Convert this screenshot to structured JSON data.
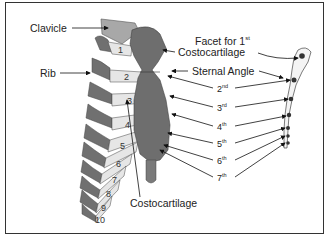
{
  "figure": {
    "type": "anatomical illustration",
    "labels": {
      "clavicle": "Clavicle",
      "rib": "Rib",
      "facet_line1": "Facet for 1",
      "facet_sup": "st",
      "facet_line2": "Costocartilage",
      "sternal_angle": "Sternal Angle",
      "costocartilage": "Costocartilage"
    },
    "ordinals": [
      {
        "num": "2",
        "sup": "nd"
      },
      {
        "num": "3",
        "sup": "rd"
      },
      {
        "num": "4",
        "sup": "th"
      },
      {
        "num": "5",
        "sup": "th"
      },
      {
        "num": "6",
        "sup": "th"
      },
      {
        "num": "7",
        "sup": "th"
      }
    ],
    "rib_numbers": [
      "1",
      "2",
      "3",
      "4",
      "5",
      "6",
      "7",
      "8",
      "9",
      "10"
    ],
    "colors": {
      "bone_dark": "#6e6e6e",
      "rib_dark": "#707070",
      "cartilage": "#e6e6e6",
      "clavicle": "#a8a8a8",
      "border": "#333333"
    }
  }
}
